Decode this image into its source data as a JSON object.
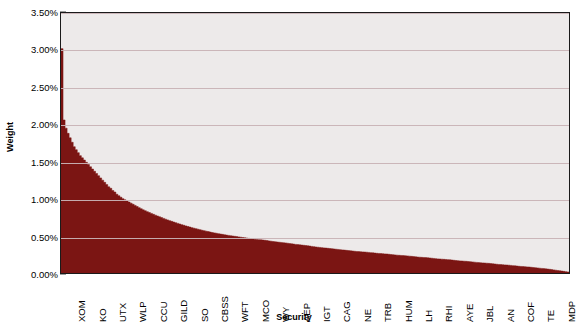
{
  "chart_data": {
    "type": "bar",
    "title": "",
    "xlabel": "Security",
    "ylabel": "Weight",
    "ylim": [
      0,
      0.035
    ],
    "grid": true,
    "legend": false,
    "legend_position": "none",
    "series_color": "#7b1513",
    "plot_background": "#edeaea",
    "gridline_color": "#c9b3b6",
    "ytick_labels": [
      "0.00%",
      "0.50%",
      "1.00%",
      "1.50%",
      "2.00%",
      "2.50%",
      "3.00%",
      "3.50%"
    ],
    "ytick_values": [
      0.0,
      0.005,
      0.01,
      0.015,
      0.02,
      0.025,
      0.03,
      0.035
    ],
    "xtick_labels": [
      "XOM",
      "KO",
      "UTX",
      "WLP",
      "CCU",
      "GILD",
      "SO",
      "CBSS",
      "WFT",
      "MCO",
      "WY",
      "AEP",
      "IGT",
      "CAG",
      "NE",
      "TRB",
      "HUM",
      "LH",
      "RHI",
      "AYE",
      "JBL",
      "AN",
      "COF",
      "TE",
      "MDP"
    ],
    "n_bars": 250,
    "values": [
      3.02,
      2.06,
      1.95,
      1.88,
      1.82,
      1.76,
      1.7,
      1.66,
      1.62,
      1.58,
      1.55,
      1.52,
      1.49,
      1.46,
      1.43,
      1.4,
      1.37,
      1.34,
      1.31,
      1.28,
      1.25,
      1.22,
      1.19,
      1.16,
      1.14,
      1.11,
      1.09,
      1.06,
      1.04,
      1.02,
      1.0,
      0.985,
      0.97,
      0.955,
      0.94,
      0.925,
      0.91,
      0.895,
      0.88,
      0.865,
      0.85,
      0.838,
      0.826,
      0.814,
      0.802,
      0.79,
      0.779,
      0.768,
      0.757,
      0.746,
      0.735,
      0.725,
      0.715,
      0.705,
      0.695,
      0.686,
      0.677,
      0.668,
      0.659,
      0.65,
      0.642,
      0.634,
      0.626,
      0.618,
      0.61,
      0.603,
      0.596,
      0.589,
      0.582,
      0.575,
      0.569,
      0.563,
      0.557,
      0.551,
      0.545,
      0.54,
      0.535,
      0.53,
      0.525,
      0.52,
      0.515,
      0.51,
      0.506,
      0.502,
      0.498,
      0.494,
      0.49,
      0.486,
      0.482,
      0.478,
      0.474,
      0.47,
      0.466,
      0.462,
      0.458,
      0.455,
      0.452,
      0.449,
      0.446,
      0.443,
      0.44,
      0.436,
      0.432,
      0.428,
      0.424,
      0.42,
      0.417,
      0.414,
      0.411,
      0.408,
      0.405,
      0.401,
      0.397,
      0.393,
      0.389,
      0.385,
      0.382,
      0.379,
      0.376,
      0.373,
      0.37,
      0.366,
      0.362,
      0.358,
      0.354,
      0.35,
      0.347,
      0.344,
      0.341,
      0.338,
      0.335,
      0.332,
      0.329,
      0.326,
      0.323,
      0.32,
      0.317,
      0.314,
      0.311,
      0.308,
      0.305,
      0.302,
      0.299,
      0.296,
      0.293,
      0.29,
      0.288,
      0.286,
      0.284,
      0.282,
      0.28,
      0.277,
      0.274,
      0.271,
      0.268,
      0.265,
      0.263,
      0.261,
      0.259,
      0.257,
      0.255,
      0.252,
      0.249,
      0.246,
      0.243,
      0.24,
      0.238,
      0.236,
      0.234,
      0.232,
      0.23,
      0.227,
      0.224,
      0.221,
      0.218,
      0.215,
      0.213,
      0.211,
      0.209,
      0.207,
      0.205,
      0.202,
      0.199,
      0.196,
      0.193,
      0.19,
      0.188,
      0.186,
      0.184,
      0.182,
      0.18,
      0.177,
      0.174,
      0.171,
      0.168,
      0.165,
      0.163,
      0.161,
      0.159,
      0.157,
      0.155,
      0.152,
      0.149,
      0.146,
      0.143,
      0.14,
      0.138,
      0.136,
      0.134,
      0.132,
      0.13,
      0.127,
      0.124,
      0.121,
      0.118,
      0.115,
      0.113,
      0.111,
      0.109,
      0.107,
      0.105,
      0.102,
      0.099,
      0.096,
      0.093,
      0.09,
      0.088,
      0.086,
      0.084,
      0.082,
      0.08,
      0.077,
      0.074,
      0.071,
      0.068,
      0.065,
      0.062,
      0.059,
      0.056,
      0.053,
      0.05,
      0.046,
      0.042,
      0.038,
      0.034,
      0.03,
      0.026,
      0.022,
      0.018,
      0.014
    ]
  }
}
